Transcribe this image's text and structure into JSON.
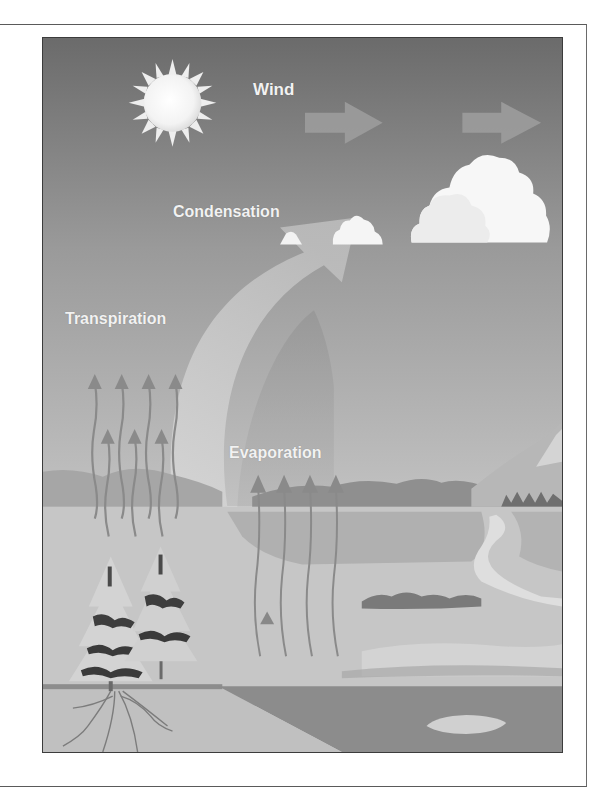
{
  "diagram": {
    "labels": {
      "wind": "Wind",
      "condensation": "Condensation",
      "transpiration": "Transpiration",
      "evaporation": "Evaporation"
    },
    "elements": {
      "sun": "sun-icon",
      "wind_arrows": 2,
      "clouds": 4,
      "trees": 2,
      "transpiration_arrows": 7,
      "evaporation_arrows": 4
    },
    "colors": {
      "sky_top": "#6e6e6e",
      "sky_bottom": "#bdbdbd",
      "ground": "#c8c8c8",
      "water": "#8a8a8a",
      "label_text": "#f2f2f2",
      "cloud": "#f7f7f7"
    }
  }
}
